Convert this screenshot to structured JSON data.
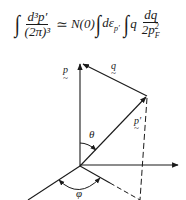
{
  "equation": {
    "lhs_integral": "∫",
    "lhs_numerator": "d³p′",
    "lhs_denominator": "(2π)³",
    "relation": "≃",
    "density_of_states": "N(0)",
    "integral_1": "∫",
    "energy_differential": "dε",
    "energy_subscript": "p′",
    "integral_2": "∫",
    "q_factor": "q",
    "rhs_numerator": "dq",
    "rhs_denominator_coef": "2p",
    "rhs_denominator_sub": "F",
    "rhs_denominator_sup": "2"
  },
  "diagram": {
    "vectors": {
      "p": "p",
      "p_prime": "p′",
      "q": "q"
    },
    "angles": {
      "theta": "θ",
      "phi": "φ"
    },
    "vector_underline_glyph": "~",
    "stroke_color": "#1a1a1a"
  }
}
